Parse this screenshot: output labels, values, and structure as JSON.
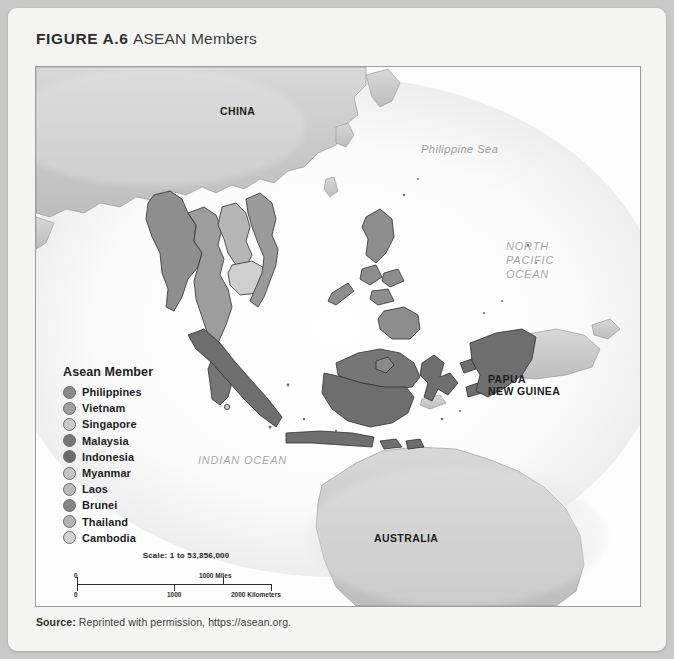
{
  "figure": {
    "label": "FIGURE A.6",
    "name": "ASEAN Members"
  },
  "map": {
    "labels": {
      "china": "CHINA",
      "papua_new_guinea_line1": "PAPUA",
      "papua_new_guinea_line2": "NEW GUINEA",
      "australia": "AUSTRALIA",
      "philippine_sea": "Philippine Sea",
      "north_pacific_line1": "NORTH",
      "north_pacific_line2": "PACIFIC",
      "north_pacific_line3": "OCEAN",
      "indian_ocean": "INDIAN OCEAN"
    },
    "colors": {
      "ocean": "#ffffff",
      "member_land": "#7a7a7a",
      "other_land": "#c2c2c2",
      "coastline": "#3c3c3c",
      "frame": "#9b9b9b"
    }
  },
  "legend": {
    "title": "Asean Member",
    "items": [
      {
        "label": "Philippines",
        "color": "#8a8a8a"
      },
      {
        "label": "Vietnam",
        "color": "#a0a0a0"
      },
      {
        "label": "Singapore",
        "color": "#c9c9c9"
      },
      {
        "label": "Malaysia",
        "color": "#777777"
      },
      {
        "label": "Indonesia",
        "color": "#6b6b6b"
      },
      {
        "label": "Myanmar",
        "color": "#c4c4c4"
      },
      {
        "label": "Laos",
        "color": "#bcbcbc"
      },
      {
        "label": "Brunei",
        "color": "#858585"
      },
      {
        "label": "Thailand",
        "color": "#b3b3b3"
      },
      {
        "label": "Cambodia",
        "color": "#d4d4d4"
      }
    ]
  },
  "scale": {
    "ratio_text": "Scale:  1 to 53,856,000",
    "miles": {
      "start": "0",
      "end": "1000 Miles"
    },
    "kilometers": {
      "start": "0",
      "mid": "1000",
      "end": "2000 Kilometers"
    }
  },
  "source": {
    "label": "Source:",
    "text": " Reprinted with permission, https://asean.org."
  }
}
